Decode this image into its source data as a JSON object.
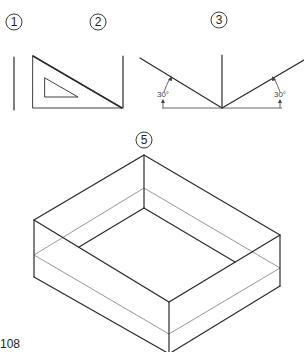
{
  "figures": [
    {
      "id": "fig1",
      "label": "1",
      "description": "vertical line"
    },
    {
      "id": "fig2",
      "label": "2",
      "description": "30-60 set square against vertical edge"
    },
    {
      "id": "fig3",
      "label": "3",
      "description": "isometric axes at 30 degrees",
      "angles": [
        {
          "side": "left",
          "text": "30°"
        },
        {
          "side": "right",
          "text": "30°"
        }
      ]
    },
    {
      "id": "fig5",
      "label": "5",
      "description": "isometric open box"
    }
  ],
  "page_number": "108",
  "colors": {
    "ink": "#2a2a2a",
    "construction_line": "#8a8a8a",
    "background": "#ffffff"
  }
}
